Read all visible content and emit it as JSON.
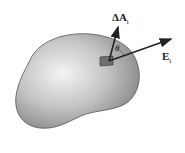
{
  "figure": {
    "labels": {
      "area_vector": "ΔA",
      "area_subscript": "i",
      "field_vector": "E",
      "field_subscript": "i",
      "angle": "θ"
    },
    "colors": {
      "surface_light": "#f4f4f4",
      "surface_dark": "#8a8a8a",
      "outline": "#555555",
      "arrow": "#222222",
      "patch": "#6f6f6f"
    }
  }
}
